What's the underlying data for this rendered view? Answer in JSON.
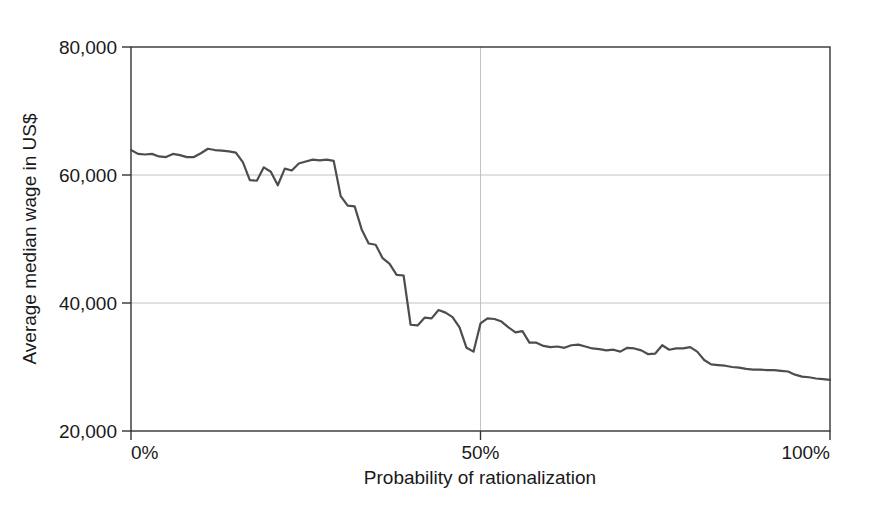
{
  "chart_data": {
    "type": "line",
    "title": "",
    "subtitle": "",
    "xlabel": "Probability of rationalization",
    "ylabel": "Average  median wage in US$",
    "xlim": [
      0,
      100
    ],
    "ylim": [
      20000,
      80000
    ],
    "x_tick_labels": [
      "0%",
      "50%",
      "100%"
    ],
    "x_tick_values": [
      0,
      50,
      100
    ],
    "y_tick_labels": [
      "20,000",
      "40,000",
      "60,000",
      "80,000"
    ],
    "y_tick_values": [
      20000,
      40000,
      60000,
      80000
    ],
    "grid": "horizontal-only-at-40000-and-60000",
    "legend": "none",
    "legend_position": "none",
    "line_color": "#4d4d4d",
    "line_width": 2.2,
    "frame_color": "#333333",
    "grid_color": "#bbbbbb",
    "x_units": "percent",
    "series": [
      {
        "name": "Average median wage",
        "x": [
          0,
          1,
          2,
          3,
          4,
          5,
          6,
          7,
          8,
          9,
          10,
          11,
          12,
          13,
          14,
          15,
          16,
          17,
          18,
          19,
          20,
          21,
          22,
          23,
          24,
          25,
          26,
          27,
          28,
          29,
          30,
          31,
          32,
          33,
          34,
          35,
          36,
          37,
          38,
          39,
          40,
          41,
          42,
          43,
          44,
          45,
          46,
          47,
          48,
          49,
          50,
          51,
          52,
          53,
          54,
          55,
          56,
          57,
          58,
          59,
          60,
          61,
          62,
          63,
          64,
          65,
          66,
          67,
          68,
          69,
          70,
          71,
          72,
          73,
          74,
          75,
          76,
          77,
          78,
          79,
          80,
          81,
          82,
          83,
          84,
          85,
          86,
          87,
          88,
          89,
          90,
          91,
          92,
          93,
          94,
          95,
          96,
          97,
          98,
          99,
          100
        ],
        "values": [
          63900,
          63300,
          63200,
          63300,
          62900,
          62800,
          63300,
          63100,
          62800,
          62800,
          63400,
          64100,
          63900,
          63800,
          63700,
          63500,
          62000,
          59200,
          59100,
          61200,
          60500,
          58400,
          61000,
          60700,
          61800,
          62100,
          62400,
          62300,
          62400,
          62200,
          56700,
          55200,
          55100,
          51500,
          49300,
          49100,
          47000,
          46100,
          44400,
          44300,
          36600,
          36500,
          37700,
          37600,
          38900,
          38500,
          37800,
          36200,
          33000,
          32400,
          36800,
          37600,
          37500,
          37100,
          36200,
          35400,
          35600,
          33800,
          33800,
          33300,
          33100,
          33200,
          33000,
          33400,
          33500,
          33200,
          32900,
          32800,
          32600,
          32700,
          32400,
          33000,
          32900,
          32600,
          32000,
          32100,
          33400,
          32700,
          32900,
          32900,
          33100,
          32400,
          31100,
          30400,
          30300,
          30200,
          30000,
          29900,
          29700,
          29600,
          29600,
          29500,
          29500,
          29400,
          29300,
          28800,
          28500,
          28400,
          28200,
          28100,
          28000
        ]
      }
    ]
  },
  "figure": {
    "background_color": "#ffffff",
    "text_color": "#1a1a1a"
  }
}
